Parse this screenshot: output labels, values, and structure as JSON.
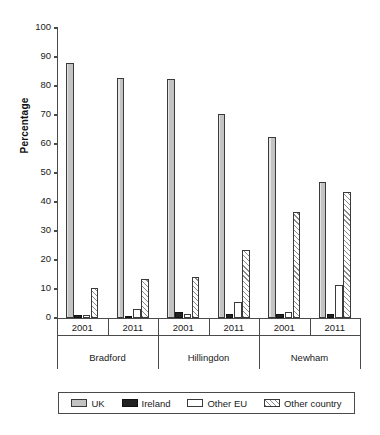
{
  "chart_data": {
    "type": "bar",
    "title": "",
    "xlabel": "",
    "ylabel": "Percentage",
    "ylim": [
      0,
      100
    ],
    "ytick_step": 10,
    "yticks": [
      0,
      10,
      20,
      30,
      40,
      50,
      60,
      70,
      80,
      90,
      100
    ],
    "grid": false,
    "legend_position": "bottom",
    "groups": [
      "Bradford",
      "Hillingdon",
      "Newham"
    ],
    "subgroups": [
      "2001",
      "2011"
    ],
    "categories": [
      "Bradford 2001",
      "Bradford 2011",
      "Hillingdon 2001",
      "Hillingdon 2011",
      "Newham 2001",
      "Newham 2011"
    ],
    "series": [
      {
        "name": "UK",
        "color": "#c3c3c3",
        "values": [
          88.0,
          82.8,
          82.3,
          70.5,
          62.5,
          47.0
        ]
      },
      {
        "name": "Ireland",
        "color": "#222222",
        "values": [
          1.0,
          0.8,
          2.0,
          1.5,
          1.5,
          1.5
        ]
      },
      {
        "name": "Other EU",
        "color": "#ffffff",
        "values": [
          1.0,
          3.0,
          1.5,
          5.5,
          2.0,
          11.5
        ]
      },
      {
        "name": "Other country",
        "color": "#8c8c8c",
        "values": [
          10.5,
          13.5,
          14.3,
          23.5,
          36.5,
          43.5
        ]
      }
    ]
  },
  "axis": {
    "y_title": "Percentage",
    "y_tick_labels": [
      "0",
      "10",
      "20",
      "30",
      "40",
      "50",
      "60",
      "70",
      "80",
      "90",
      "100"
    ]
  },
  "x_axis": {
    "groups": [
      {
        "label": "Bradford",
        "years": [
          "2001",
          "2011"
        ]
      },
      {
        "label": "Hillingdon",
        "years": [
          "2001",
          "2011"
        ]
      },
      {
        "label": "Newham",
        "years": [
          "2001",
          "2011"
        ]
      }
    ]
  },
  "legend": {
    "items": [
      {
        "label": "UK",
        "swatch": "uk"
      },
      {
        "label": "Ireland",
        "swatch": "ireland"
      },
      {
        "label": "Other EU",
        "swatch": "otherEU"
      },
      {
        "label": "Other country",
        "swatch": "otherCountry"
      }
    ]
  }
}
